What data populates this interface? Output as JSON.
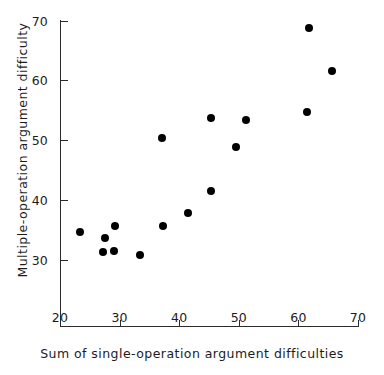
{
  "chart_data": {
    "type": "scatter",
    "title": "",
    "xlabel": "Sum of single-operation argument difficulties",
    "ylabel": "Multiple-operation argument difficulty",
    "xlim": [
      20,
      70
    ],
    "ylim": [
      20,
      70
    ],
    "xticks": [
      20,
      30,
      40,
      50,
      60,
      70
    ],
    "yticks": [
      30,
      40,
      50,
      60,
      70
    ],
    "xtick_labels": [
      "20",
      "30",
      "40",
      "50",
      "60",
      "70"
    ],
    "ytick_labels": [
      "30",
      "40",
      "50",
      "60",
      "70"
    ],
    "grid": false,
    "legend": null,
    "marker": "filled-circle",
    "marker_color": "#000000",
    "axis_color": "#2b2b2b",
    "background_color": "#ffffff",
    "points": [
      {
        "x": 23.4,
        "y": 34.6
      },
      {
        "x": 27.2,
        "y": 31.3
      },
      {
        "x": 27.6,
        "y": 33.6
      },
      {
        "x": 29.1,
        "y": 31.4
      },
      {
        "x": 29.2,
        "y": 35.6
      },
      {
        "x": 33.4,
        "y": 30.7
      },
      {
        "x": 37.1,
        "y": 50.4
      },
      {
        "x": 37.3,
        "y": 35.6
      },
      {
        "x": 41.5,
        "y": 37.8
      },
      {
        "x": 45.3,
        "y": 41.5
      },
      {
        "x": 45.3,
        "y": 53.6
      },
      {
        "x": 49.5,
        "y": 48.8
      },
      {
        "x": 51.2,
        "y": 53.3
      },
      {
        "x": 61.5,
        "y": 54.7
      },
      {
        "x": 61.8,
        "y": 68.8
      },
      {
        "x": 65.7,
        "y": 61.6
      }
    ]
  }
}
